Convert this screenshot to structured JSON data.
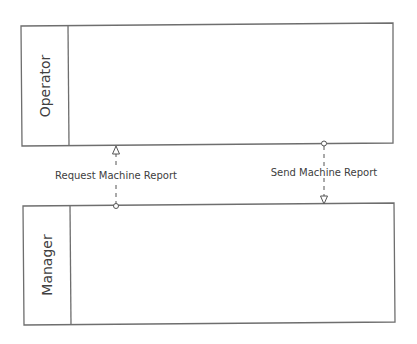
{
  "diagram": {
    "type": "swimlane-message-flow",
    "colors": {
      "stroke": "#6e6e6e",
      "text": "#404040",
      "background": "#ffffff"
    },
    "lanes": [
      {
        "id": "operator",
        "label": "Operator"
      },
      {
        "id": "manager",
        "label": "Manager"
      }
    ],
    "flows": [
      {
        "id": "request",
        "label": "Request Machine Report",
        "from": "Manager",
        "to": "Operator",
        "style": "dashed"
      },
      {
        "id": "send",
        "label": "Send Machine Report",
        "from": "Operator",
        "to": "Manager",
        "style": "dashed"
      }
    ]
  }
}
